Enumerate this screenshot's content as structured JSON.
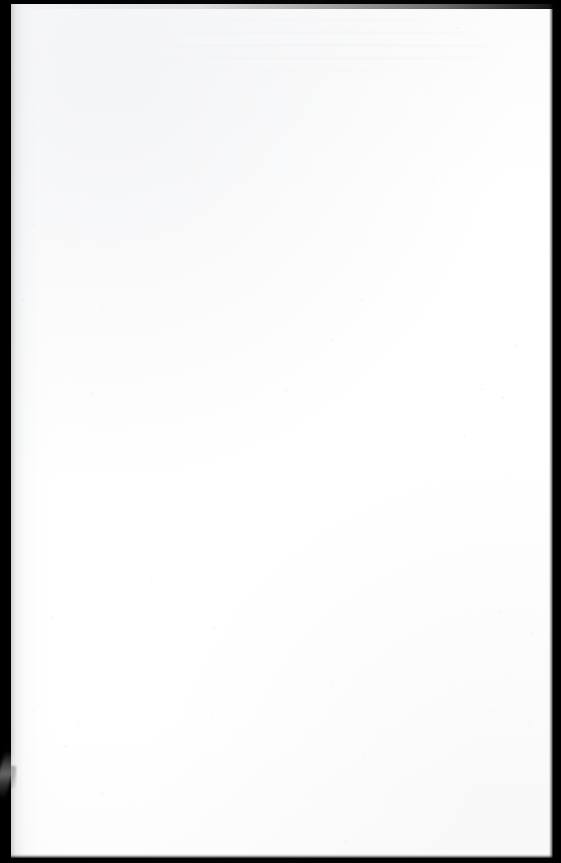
{
  "document": {
    "kind": "scanned-page",
    "title": "",
    "header_text": "",
    "footer_text": "",
    "page_number": "",
    "body_text": "",
    "content_summary": "blank page",
    "width_px": 561,
    "height_px": 863
  },
  "page": {
    "paper_color": "#ffffff",
    "sheet_left_px": 11,
    "sheet_top_px": 4,
    "sheet_width_px": 542,
    "sheet_height_px": 854
  },
  "scan_frame": {
    "background_color": "#000000",
    "border_left_px": 11,
    "border_top_px": 4,
    "border_right_px": 7,
    "border_bottom_px": 5
  },
  "artifacts": {
    "gutter_shadow": {
      "label": "binding gutter shadow",
      "side": "left",
      "shadow_color": "#aaaeb2"
    },
    "edge_streak": {
      "label": "diagonal light streak",
      "location": "lower-left black border",
      "x_px": 0,
      "y_px": 755,
      "color": "#9a9a9a"
    },
    "show_through": {
      "label": "reverse-side bleed-through",
      "location": "upper-center",
      "color": "#eeeff1"
    },
    "speckles": {
      "label": "dust speckle noise",
      "color": "#e9eaec"
    }
  }
}
